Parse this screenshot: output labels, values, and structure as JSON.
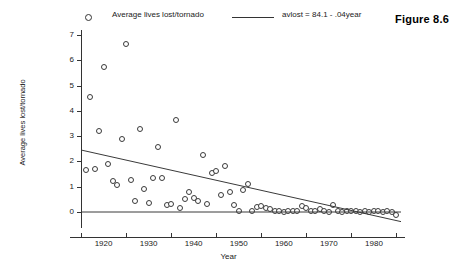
{
  "figure": {
    "label": "Figure 8.6"
  },
  "legend": {
    "marker_icon": "open-circle-marker",
    "series_label": "Average lives lost/tornado",
    "line_icon": "regression-line-swatch",
    "fit_label": "avlost = 84.1 - .04year"
  },
  "chart_data": {
    "type": "scatter",
    "title": "",
    "xlabel": "Year",
    "ylabel": "Average lives lost/tornado",
    "xlim": [
      1915,
      1986
    ],
    "ylim": [
      -0.55,
      7.4
    ],
    "xticks": [
      1920,
      1930,
      1940,
      1950,
      1960,
      1970,
      1980
    ],
    "xtick_labels": [
      "1920",
      "1930",
      "1940",
      "1950",
      "1960",
      "1970",
      "1980"
    ],
    "xminor_ticks": [
      1915,
      1925,
      1935,
      1945,
      1955,
      1965,
      1975,
      1985
    ],
    "yticks": [
      0,
      1,
      2,
      3,
      4,
      5,
      6,
      7
    ],
    "ytick_labels": [
      "0",
      "1",
      "2",
      "3",
      "4",
      "5",
      "6",
      "7"
    ],
    "grid": false,
    "legend_position": "top",
    "marker": "open-circle",
    "series": [
      {
        "name": "Average lives lost/tornado",
        "x": [
          1916,
          1917,
          1918,
          1919,
          1920,
          1921,
          1922,
          1923,
          1924,
          1925,
          1926,
          1927,
          1928,
          1929,
          1930,
          1931,
          1932,
          1933,
          1934,
          1935,
          1936,
          1937,
          1938,
          1939,
          1940,
          1941,
          1942,
          1943,
          1944,
          1945,
          1946,
          1947,
          1948,
          1949,
          1950,
          1951,
          1952,
          1953,
          1954,
          1955,
          1956,
          1957,
          1958,
          1959,
          1960,
          1961,
          1962,
          1963,
          1964,
          1965,
          1966,
          1967,
          1968,
          1969,
          1970,
          1971,
          1972,
          1973,
          1974,
          1975,
          1976,
          1977,
          1978,
          1979,
          1980,
          1981,
          1982,
          1983,
          1984,
          1985
        ],
        "y": [
          1.66,
          4.53,
          1.68,
          3.2,
          5.73,
          1.9,
          1.23,
          1.06,
          2.88,
          6.65,
          1.27,
          0.44,
          3.28,
          0.92,
          0.36,
          1.35,
          2.57,
          1.34,
          0.27,
          0.3,
          3.62,
          0.14,
          0.5,
          0.8,
          0.55,
          0.45,
          2.24,
          0.33,
          1.56,
          1.63,
          0.67,
          1.82,
          0.78,
          0.27,
          0.02,
          0.86,
          1.12,
          0.05,
          0.2,
          0.22,
          0.15,
          0.1,
          0.05,
          0.02,
          0.0,
          0.02,
          0.05,
          0.03,
          0.25,
          0.15,
          0.05,
          0.02,
          0.12,
          0.02,
          0.0,
          0.26,
          0.02,
          0.0,
          0.05,
          0.03,
          0.02,
          0.0,
          0.05,
          0.0,
          0.02,
          0.05,
          0.0,
          0.02,
          0.0,
          -0.1
        ]
      }
    ],
    "fit_line": {
      "label": "avlost = 84.1 - .04year",
      "intercept": 84.1,
      "slope": -0.04,
      "x_start": 1915,
      "y_start": 2.45,
      "x_end": 1986,
      "y_end": -0.38
    },
    "reference_line": {
      "name": "zero-line",
      "y": 0,
      "x_start": 1915,
      "x_end": 1986
    }
  }
}
